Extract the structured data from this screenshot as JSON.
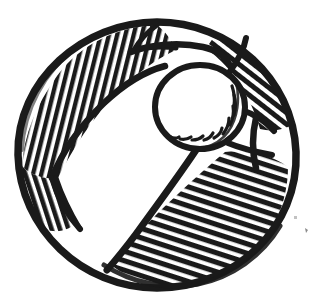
{
  "canvas": {
    "width": 317,
    "height": 306,
    "background_color": "#ffffff",
    "ink_color": "#1a1a1a",
    "title": "Beach Ball Line Drawing",
    "style": "hand-drawn woodcut hatched line art",
    "subject": "beach-ball"
  },
  "ball": {
    "name": "beach-ball",
    "center_x": 157,
    "center_y": 155,
    "radius_x": 139,
    "radius_y": 133,
    "outline_width": 7,
    "bounds": {
      "left": 18,
      "top": 22,
      "right": 296,
      "bottom": 288
    }
  },
  "pole_cap": {
    "name": "center-circle",
    "center_x": 200,
    "center_y": 107,
    "radius_x": 46,
    "radius_y": 43,
    "fill": "white",
    "outline_width": 6,
    "inner_shading": {
      "name": "inner-arc-hatching",
      "description": "short curved hatch strokes along lower-right inner rim",
      "stroke_count": 9
    }
  },
  "segments": [
    {
      "id": "segment-top",
      "label": "Top segment",
      "fill": "white",
      "hatched": false,
      "start_angle": -108,
      "end_angle": -58
    },
    {
      "id": "segment-upper-left",
      "label": "Upper left segment",
      "fill": "hatched",
      "hatched": true,
      "hatch_angle_deg": 78,
      "hatch_spacing": 8,
      "stroke_count": 26,
      "start_angle": -178,
      "end_angle": -108
    },
    {
      "id": "segment-left",
      "label": "Left segment",
      "fill": "hatched",
      "hatched": true,
      "hatch_angle_deg": 100,
      "hatch_spacing": 8,
      "stroke_count": 22,
      "start_angle": 178,
      "end_angle": 128
    },
    {
      "id": "segment-lower-left",
      "label": "Lower left segment",
      "fill": "white",
      "hatched": false,
      "start_angle": 128,
      "end_angle": 62
    },
    {
      "id": "segment-lower-right",
      "label": "Lower right segment",
      "fill": "hatched",
      "hatched": true,
      "hatch_angle_deg": 18,
      "hatch_spacing": 9,
      "stroke_count": 30,
      "start_angle": 62,
      "end_angle": 8
    },
    {
      "id": "segment-right",
      "label": "Right segment",
      "fill": "white",
      "hatched": false,
      "start_angle": 8,
      "end_angle": -28
    },
    {
      "id": "segment-upper-right",
      "label": "Upper right segment",
      "fill": "hatched",
      "hatched": true,
      "hatch_angle_deg": 142,
      "hatch_spacing": 9,
      "stroke_count": 14,
      "start_angle": -28,
      "end_angle": -58
    }
  ],
  "artifacts": [
    {
      "id": "speck-right",
      "label": "ink speck",
      "x": 305,
      "y": 229,
      "width": 4,
      "height": 5
    },
    {
      "id": "speck-right-upper",
      "label": "faint ink speck",
      "x": 294,
      "y": 216,
      "width": 3,
      "height": 3
    }
  ]
}
